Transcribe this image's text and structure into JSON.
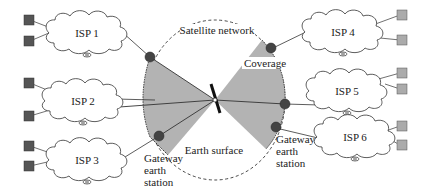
{
  "diagram": {
    "type": "satellite-network-topology",
    "colors": {
      "line": "#333333",
      "coverage_fill": "#b3b3b3",
      "gateway_node": "#444444",
      "host_left": "#555555",
      "host_right": "#ababab",
      "background": "#ffffff"
    },
    "labels": {
      "satellite_network": "Satellite network",
      "coverage": "Coverage",
      "earth_surface": "Earth surface",
      "gateway_left": [
        "Gateway",
        "earth",
        "station"
      ],
      "gateway_right": [
        "Gateway",
        "earth",
        "station"
      ]
    },
    "isps": [
      {
        "label": "ISP 1",
        "side": "left",
        "hosts": 2
      },
      {
        "label": "ISP 2",
        "side": "left",
        "hosts": 2
      },
      {
        "label": "ISP 3",
        "side": "left",
        "hosts": 2
      },
      {
        "label": "ISP 4",
        "side": "right",
        "hosts": 2
      },
      {
        "label": "ISP 5",
        "side": "right",
        "hosts": 2
      },
      {
        "label": "ISP 6",
        "side": "right",
        "hosts": 2
      }
    ],
    "nodes": {
      "satellite": {
        "label": "satellite-icon"
      },
      "gateways": 6
    }
  }
}
